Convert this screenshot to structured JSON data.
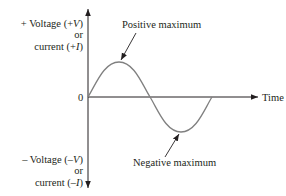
{
  "diagram": {
    "type": "sine-wave",
    "axes": {
      "y_positive_label": [
        "+ Voltage (+V)",
        "or",
        "current (+I)"
      ],
      "y_negative_label": [
        "– Voltage (–V)",
        "or",
        "current (–I)"
      ],
      "origin_label": "0",
      "x_label": "Time (t)"
    },
    "annotations": {
      "positive_peak": "Positive maximum",
      "negative_peak": "Negative maximum"
    },
    "colors": {
      "axis": "#231f20",
      "curve": "#808080",
      "text": "#231f20"
    }
  },
  "labels": {
    "y_pos_line1": "+ Voltage (+",
    "y_pos_var1": "V",
    "y_pos_line1_end": ")",
    "y_pos_line2": "or",
    "y_pos_line3": "current (+",
    "y_pos_var3": "I",
    "y_pos_line3_end": ")",
    "y_neg_line1": "– Voltage (–",
    "y_neg_var1": "V",
    "y_neg_line1_end": ")",
    "y_neg_line2": "or",
    "y_neg_line3": "current (–",
    "y_neg_var3": "I",
    "y_neg_line3_end": ")",
    "origin": "0",
    "x_axis": "Time (",
    "x_var": "t",
    "x_axis_end": ")",
    "pos_max": "Positive maximum",
    "neg_max": "Negative maximum"
  }
}
